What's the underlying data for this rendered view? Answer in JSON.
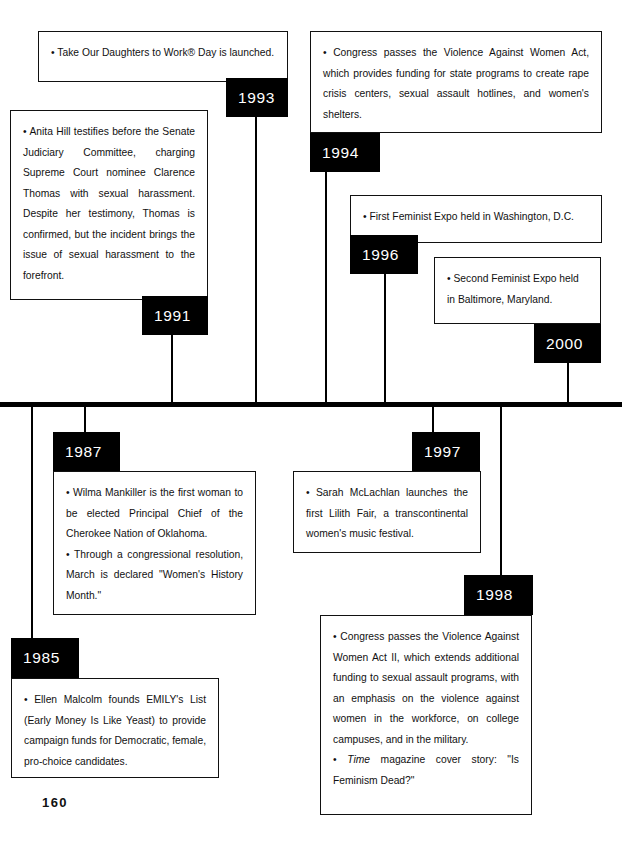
{
  "page": {
    "number": "160"
  },
  "timeline": {
    "axis_color": "#000000",
    "marker_bg": "#000000",
    "marker_text_color": "#ffffff"
  },
  "events": [
    {
      "id": "e1993",
      "year": "1993",
      "side": "above",
      "paragraphs": [
        "• Take Our Daughters to Work® Day is launched."
      ]
    },
    {
      "id": "e1994",
      "year": "1994",
      "side": "above",
      "paragraphs": [
        "• Congress passes the Violence Against Women Act, which provides funding for state programs to create rape crisis centers, sexual assault hotlines, and women's shelters."
      ]
    },
    {
      "id": "e1991",
      "year": "1991",
      "side": "above",
      "paragraphs": [
        "• Anita Hill testifies before the Senate Judiciary Committee, charging Supreme Court nominee Clarence Thomas with sexual harassment. Despite her testimony, Thomas is confirmed, but the incident brings the issue of sexual harassment to the forefront."
      ]
    },
    {
      "id": "e1996",
      "year": "1996",
      "side": "above",
      "paragraphs": [
        "• First Feminist Expo held in Washington, D.C."
      ]
    },
    {
      "id": "e2000",
      "year": "2000",
      "side": "above",
      "paragraphs": [
        "• Second Feminist Expo held in Baltimore, Maryland."
      ]
    },
    {
      "id": "e1987",
      "year": "1987",
      "side": "below",
      "paragraphs": [
        "• Wilma Mankiller is the first woman to be elected Principal Chief of the Cherokee Nation of Oklahoma.",
        "• Through a congressional resolution, March is declared \"Women's History Month.\""
      ]
    },
    {
      "id": "e1997",
      "year": "1997",
      "side": "below",
      "paragraphs": [
        "• Sarah McLachlan launches the first Lilith Fair, a transcontinental women's music festival."
      ]
    },
    {
      "id": "e1998",
      "year": "1998",
      "side": "below",
      "paragraphs_rich": [
        "• Congress passes the Violence Against Women Act II, which extends additional funding to sexual assault programs, with an emphasis on the violence against women in the workforce, on college campuses, and in the military.",
        "• Time magazine cover story: \"Is Feminism Dead?\""
      ]
    },
    {
      "id": "e1985",
      "year": "1985",
      "side": "below",
      "paragraphs": [
        "• Ellen Malcolm founds EMILY's List (Early Money Is Like Yeast) to provide campaign funds for Democratic, female, pro-choice candidates."
      ]
    }
  ],
  "text": {
    "e1993_p0": "• Take Our Daughters to Work® Day is launched.",
    "e1994_p0": "• Congress passes the Violence Against Women Act, which provides funding for state programs to create rape crisis centers, sexual assault hotlines, and women's shelters.",
    "e1991_p0": "• Anita Hill testifies before the Senate Judiciary Committee, charging Supreme Court nominee Clarence Thomas with sexual harassment. Despite her testimony, Thomas is confirmed, but the incident brings the issue of sexual harassment to the forefront.",
    "e1996_p0": "• First Feminist Expo held in Washington, D.C.",
    "e2000_p0": "• Second Feminist Expo held in Baltimore, Maryland.",
    "e1987_p0": "• Wilma Mankiller is the first woman to be elected Principal Chief of the Cherokee Nation of Oklahoma.",
    "e1987_p1": "• Through a congressional resolution, March is declared \"Women's History Month.\"",
    "e1997_p0": "• Sarah McLachlan launches the first Lilith Fair, a transcontinental women's music festival.",
    "e1998_p0": "• Congress passes the Violence Against Women Act II, which extends additional funding to sexual assault programs, with an emphasis on the violence against women in the workforce, on college campuses, and in the military.",
    "e1998_p1_bullet": "• ",
    "e1998_p1_italic": "Time",
    "e1998_p1_rest": " magazine cover story: \"Is Feminism Dead?\"",
    "e1985_p0": "• Ellen Malcolm founds EMILY's List (Early Money Is Like Yeast) to provide campaign funds for Democratic, female, pro-choice candidates."
  },
  "years": {
    "y1985": "1985",
    "y1987": "1987",
    "y1991": "1991",
    "y1993": "1993",
    "y1994": "1994",
    "y1996": "1996",
    "y1997": "1997",
    "y1998": "1998",
    "y2000": "2000"
  }
}
